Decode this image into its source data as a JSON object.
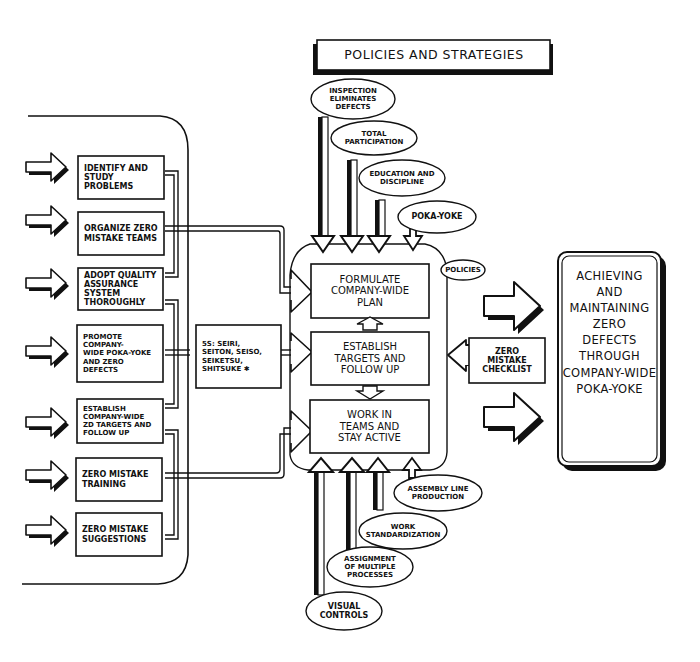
{
  "title": {
    "label": "Policies and Strategies"
  },
  "left_panel": {
    "items": [
      {
        "label": "Identify and\nstudy problems"
      },
      {
        "label": "Organize zero\nmistake teams"
      },
      {
        "label": "Adopt quality\nassurance\nsystem\nthoroughly"
      },
      {
        "label": "Promote company-\nwide Poka-Yoke\nand zero\ndefects"
      },
      {
        "label": "Establish\ncompany-wide\nZD targets and\nfollow up"
      },
      {
        "label": "Zero mistake\ntraining"
      },
      {
        "label": "Zero mistake\nsuggestions"
      }
    ]
  },
  "five_s": {
    "label": "5S: Seiri,\nSeiton, Seiso,\nSeiketsu,\nShitsuke ✱"
  },
  "center": {
    "steps": [
      {
        "label": "Formulate\ncompany-wide\nplan"
      },
      {
        "label": "Establish\ntargets and\nfollow up"
      },
      {
        "label": "Work in\nteams and\nstay active"
      }
    ],
    "policies_tag": "Policies"
  },
  "top_inputs": [
    {
      "label": "Inspection\neliminates\ndefects"
    },
    {
      "label": "Total\nparticipation"
    },
    {
      "label": "Education and\ndiscipline"
    },
    {
      "label": "Poka-Yoke"
    }
  ],
  "bottom_inputs": [
    {
      "label": "Assembly line\nproduction"
    },
    {
      "label": "Work\nstandardization"
    },
    {
      "label": "Assignment\nof multiple\nprocesses"
    },
    {
      "label": "Visual\ncontrols"
    }
  ],
  "checklist": {
    "label": "Zero\nmistake\nchecklist"
  },
  "goal": {
    "label": "Achieving\nand\nmaintaining\nzero\ndefects\nthrough\ncompany-wide\nPoka-Yoke"
  },
  "colors": {
    "ink": "#111111",
    "paper": "#ffffff"
  }
}
